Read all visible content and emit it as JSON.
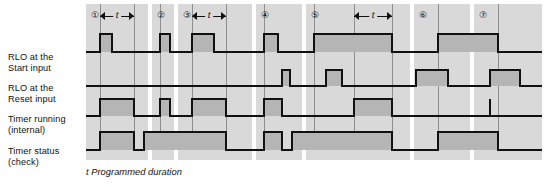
{
  "figure": {
    "caption": "t Programmed duration",
    "t_label": "t",
    "colors": {
      "band": "#d9d9d9",
      "pulse_fill": "#b5b5b5",
      "stroke": "#111111",
      "gridline": "#8e8e8e",
      "background": "#ffffff"
    }
  },
  "rows": [
    {
      "id": "rlo-start",
      "line1": "RLO at the",
      "line2": "Start input"
    },
    {
      "id": "rlo-reset",
      "line1": "RLO at the",
      "line2": "Reset input"
    },
    {
      "id": "timer-running",
      "line1": "Timer running",
      "line2": "(internal)"
    },
    {
      "id": "timer-status",
      "line1": "Timer status",
      "line2": "(check)"
    }
  ],
  "sections": [
    {
      "number": "①",
      "x": 0,
      "w": 62
    },
    {
      "number": "②",
      "x": 66,
      "w": 22
    },
    {
      "number": "③",
      "x": 92,
      "w": 74
    },
    {
      "number": "④",
      "x": 170,
      "w": 46
    },
    {
      "number": "⑤",
      "x": 220,
      "w": 104
    },
    {
      "number": "⑥",
      "x": 328,
      "w": 56
    },
    {
      "number": "⑦",
      "x": 388,
      "w": 68
    }
  ],
  "gridlines": [
    {
      "x": 14,
      "y": 0,
      "h": 130
    },
    {
      "x": 48,
      "y": 0,
      "h": 130
    },
    {
      "x": 74,
      "y": 0,
      "h": 130
    },
    {
      "x": 106,
      "y": 0,
      "h": 130
    },
    {
      "x": 140,
      "y": 0,
      "h": 130
    },
    {
      "x": 178,
      "y": 0,
      "h": 130
    },
    {
      "x": 228,
      "y": 0,
      "h": 130
    },
    {
      "x": 268,
      "y": 0,
      "h": 130
    },
    {
      "x": 306,
      "y": 0,
      "h": 130
    },
    {
      "x": 352,
      "y": 0,
      "h": 130
    },
    {
      "x": 412,
      "y": 0,
      "h": 130
    }
  ],
  "t_markers": [
    {
      "x": 14,
      "w": 34
    },
    {
      "x": 106,
      "w": 34
    },
    {
      "x": 268,
      "w": 38
    }
  ],
  "chart_data": {
    "type": "line",
    "xlabel": "",
    "ylabel": "",
    "baselines_px": {
      "rlo-start": 48,
      "rlo-reset": 82,
      "timer-running": 112,
      "timer-status": 146
    },
    "pulse_height_px": {
      "rlo-start": 18,
      "rlo-reset": 16,
      "timer-running": 17,
      "timer-status": 18
    },
    "series": [
      {
        "name": "RLO at the Start input",
        "pulses": [
          {
            "from": 14,
            "to": 26
          },
          {
            "from": 74,
            "to": 84
          },
          {
            "from": 106,
            "to": 128
          },
          {
            "from": 178,
            "to": 192
          },
          {
            "from": 228,
            "to": 306
          },
          {
            "from": 352,
            "to": 412
          }
        ]
      },
      {
        "name": "RLO at the Reset input",
        "pulses": [
          {
            "from": 196,
            "to": 204
          },
          {
            "from": 240,
            "to": 256
          },
          {
            "from": 330,
            "to": 362
          },
          {
            "from": 404,
            "to": 434
          }
        ]
      },
      {
        "name": "Timer running (internal)",
        "pulses": [
          {
            "from": 14,
            "to": 48
          },
          {
            "from": 74,
            "to": 84
          },
          {
            "from": 106,
            "to": 140
          },
          {
            "from": 178,
            "to": 196
          },
          {
            "from": 268,
            "to": 306
          }
        ],
        "spikes": [
          {
            "x": 404
          }
        ]
      },
      {
        "name": "Timer status (check)",
        "pulses": [
          {
            "from": 14,
            "to": 48
          },
          {
            "from": 58,
            "to": 140
          },
          {
            "from": 178,
            "to": 196
          },
          {
            "from": 206,
            "to": 306
          },
          {
            "from": 352,
            "to": 412
          }
        ]
      }
    ]
  }
}
